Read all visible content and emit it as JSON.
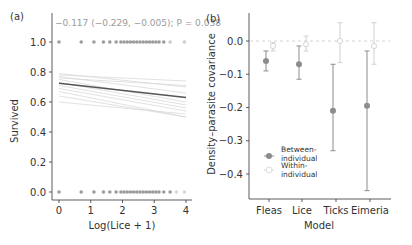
{
  "chart_data": [
    {
      "panel_label": "(a)",
      "type": "scatter",
      "title": "",
      "annotation": "−0.117 (−0.229, −0.005); P = 0.038",
      "xlabel": "Log(Lice + 1)",
      "ylabel": "Survived",
      "xlim": [
        0,
        4
      ],
      "ylim": [
        0.0,
        1.0
      ],
      "xticks": [
        "0",
        "1",
        "2",
        "3",
        "4"
      ],
      "yticks": [
        "0.0",
        "0.2",
        "0.4",
        "0.6",
        "0.8",
        "1.0"
      ],
      "grid": false,
      "points_survived_1": [
        0,
        0.7,
        1.1,
        1.4,
        1.6,
        1.8,
        1.95,
        2.05,
        2.15,
        2.25,
        2.35,
        2.45,
        2.55,
        2.65,
        2.75,
        2.85,
        2.95,
        3.05,
        3.15,
        3.3,
        3.5,
        3.95
      ],
      "points_survived_0": [
        0,
        0.7,
        1.1,
        1.4,
        1.6,
        1.8,
        1.95,
        2.05,
        2.15,
        2.25,
        2.35,
        2.45,
        2.55,
        2.65,
        2.75,
        2.85,
        2.95,
        3.05,
        3.15,
        3.3,
        3.5,
        3.7,
        3.95
      ],
      "fitted_line": {
        "x": [
          0,
          4
        ],
        "y": [
          0.725,
          0.63
        ]
      },
      "individual_lines": [
        {
          "y0": 0.79,
          "y1": 0.7
        },
        {
          "y0": 0.77,
          "y1": 0.66
        },
        {
          "y0": 0.75,
          "y1": 0.6
        },
        {
          "y0": 0.73,
          "y1": 0.58
        },
        {
          "y0": 0.71,
          "y1": 0.56
        },
        {
          "y0": 0.69,
          "y1": 0.54
        },
        {
          "y0": 0.67,
          "y1": 0.5
        },
        {
          "y0": 0.64,
          "y1": 0.5
        },
        {
          "y0": 0.6,
          "y1": 0.52
        },
        {
          "y0": 0.78,
          "y1": 0.74
        },
        {
          "y0": 0.76,
          "y1": 0.71
        }
      ]
    },
    {
      "panel_label": "(b)",
      "type": "scatter",
      "title": "",
      "xlabel": "Model",
      "ylabel": "Density–parasite covariance",
      "categories": [
        "Fleas",
        "Lice",
        "Ticks",
        "Eimeria"
      ],
      "yticks": [
        "0.0",
        "−0.1",
        "−0.2",
        "−0.3",
        "−0.4"
      ],
      "ylim": [
        -0.47,
        0.07
      ],
      "reference_line": 0.0,
      "legend": [
        "Between-individual",
        "Within-individual"
      ],
      "legend_position": "lower left",
      "series": [
        {
          "name": "Between-individual",
          "values": [
            -0.06,
            -0.07,
            -0.21,
            -0.195
          ],
          "lower": [
            -0.09,
            -0.115,
            -0.33,
            -0.45
          ],
          "upper": [
            -0.03,
            -0.015,
            -0.07,
            -0.03
          ]
        },
        {
          "name": "Within-individual",
          "values": [
            -0.015,
            -0.01,
            0.0,
            -0.015
          ],
          "lower": [
            -0.03,
            -0.03,
            -0.065,
            -0.07
          ],
          "upper": [
            -0.005,
            0.015,
            0.055,
            0.055
          ]
        }
      ]
    }
  ],
  "panels": {
    "a": {
      "label": "(a)",
      "annotation": "−0.117 (−0.229, −0.005); P = 0.038",
      "xlabel": "Log(Lice + 1)",
      "ylabel": "Survived",
      "xticks": [
        "0",
        "1",
        "2",
        "3",
        "4"
      ],
      "yticks": [
        "0.0",
        "0.2",
        "0.4",
        "0.6",
        "0.8",
        "1.0"
      ]
    },
    "b": {
      "label": "(b)",
      "xlabel": "Model",
      "ylabel": "Density–parasite covariance",
      "categories": [
        "Fleas",
        "Lice",
        "Ticks",
        "Eimeria"
      ],
      "yticks": [
        "0.0",
        "−0.1",
        "−0.2",
        "−0.3",
        "−0.4"
      ],
      "legend": {
        "between_line1": "Between-",
        "between_line2": "individual",
        "within_line1": "Within-",
        "within_line2": "individual"
      }
    }
  },
  "colors": {
    "between": "#8c8c8c",
    "within": "#d0d0d0",
    "fit_line": "#555555",
    "individual_lines": "#d9d9d9",
    "axis": "#333333",
    "text": "#333333",
    "annotation": "#9a9a9a"
  }
}
